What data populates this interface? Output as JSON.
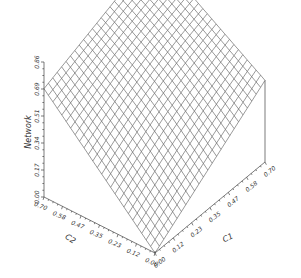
{
  "chart_data": {
    "type": "surface",
    "title": "",
    "xlabel": "C1",
    "ylabel": "C2",
    "zlabel": "Network",
    "x_ticks": [
      "0.00",
      "0.12",
      "0.23",
      "0.35",
      "0.47",
      "0.58",
      "0.70"
    ],
    "y_ticks": [
      "0.00",
      "0.12",
      "0.23",
      "0.35",
      "0.47",
      "0.58",
      "0.70"
    ],
    "z_ticks": [
      "0.00",
      "0.17",
      "0.34",
      "0.51",
      "0.69",
      "0.86"
    ],
    "xlim": [
      0,
      0.7
    ],
    "ylim": [
      0,
      0.7
    ],
    "zlim": [
      0,
      0.86
    ],
    "grid_resolution": 25,
    "corner_values": {
      "c1_0_c2_0": 0.0,
      "c1_max_c2_0": 0.52,
      "c1_0_c2_max": 0.69,
      "c1_max_c2_max": 0.98
    },
    "grid": false,
    "legend": "none",
    "mesh_color": "#555555"
  }
}
